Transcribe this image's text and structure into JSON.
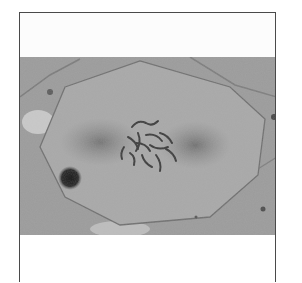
{
  "figure": {
    "type": "micrograph",
    "colors": {
      "background": "#9d9d9d",
      "cell_interior": "#a9a9a9",
      "border": "#4a4a4a",
      "chromosomes": "#3a3a3a",
      "dark_particle": "#1e1e1e",
      "page": "#ffffff"
    },
    "caption": "",
    "footer": ""
  }
}
